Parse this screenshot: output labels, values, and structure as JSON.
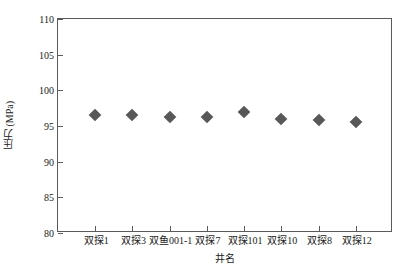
{
  "chart_data": {
    "type": "scatter",
    "title": "",
    "xlabel": "井名",
    "ylabel": "压力 (MPa)",
    "categories": [
      "双探1",
      "双探3",
      "双鱼001-1",
      "双探7",
      "双探101",
      "双探10",
      "双探8",
      "双探12"
    ],
    "values": [
      96.6,
      96.6,
      96.2,
      96.2,
      97.0,
      96.0,
      95.9,
      95.6
    ],
    "ylim": [
      80,
      110
    ],
    "yticks": [
      80,
      85,
      90,
      95,
      100,
      105,
      110
    ],
    "ytick_labels": [
      "80",
      "85",
      "90",
      "95",
      "100",
      "105",
      "110"
    ],
    "grid": false,
    "legend": null,
    "marker": {
      "shape": "diamond",
      "color": "#585858"
    },
    "axis_color": "#5a5a5a"
  }
}
